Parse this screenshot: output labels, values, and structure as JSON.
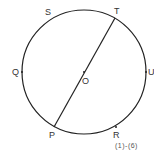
{
  "diagram": {
    "center": {
      "label": "O",
      "x": 84,
      "y": 72
    },
    "radius": 62,
    "points": [
      {
        "label": "S",
        "x": 58,
        "y": 15
      },
      {
        "label": "T",
        "x": 115,
        "y": 18
      },
      {
        "label": "Q",
        "x": 22,
        "y": 72
      },
      {
        "label": "U",
        "x": 146,
        "y": 72
      },
      {
        "label": "P",
        "x": 54,
        "y": 127
      },
      {
        "label": "R",
        "x": 116,
        "y": 127
      }
    ],
    "segment": [
      "T",
      "P"
    ],
    "caption": "(1)-(6)"
  }
}
